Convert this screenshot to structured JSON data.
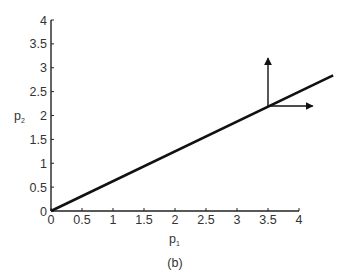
{
  "chart_data": {
    "type": "line",
    "title": "",
    "caption": "(b)",
    "xlabel": "p1",
    "ylabel": "p2",
    "xlabel_main": "p",
    "xlabel_sub": "1",
    "ylabel_main": "p",
    "ylabel_sub": "2",
    "xlim": [
      0,
      4
    ],
    "ylim": [
      0,
      4
    ],
    "xticks": [
      0,
      0.5,
      1,
      1.5,
      2,
      2.5,
      3,
      3.5,
      4
    ],
    "xtick_labels": [
      "0",
      "0.5",
      "1",
      "1.5",
      "2",
      "2.5",
      "3",
      "3.5",
      "4"
    ],
    "yticks": [
      0,
      0.5,
      1,
      1.5,
      2,
      2.5,
      3,
      3.5,
      4
    ],
    "ytick_labels": [
      "0",
      "0.5",
      "1",
      "1.5",
      "2",
      "2.5",
      "3",
      "3.5",
      "4"
    ],
    "grid": false,
    "legend": null,
    "series": [
      {
        "name": "line",
        "x": [
          0,
          4.55
        ],
        "y": [
          0,
          2.84
        ],
        "color": "#111111"
      }
    ],
    "annotations": [
      {
        "type": "arrow",
        "from": [
          3.5,
          2.2
        ],
        "to": [
          3.5,
          3.2
        ],
        "direction": "up"
      },
      {
        "type": "arrow",
        "from": [
          3.5,
          2.2
        ],
        "to": [
          4.22,
          2.2
        ],
        "direction": "right"
      }
    ]
  }
}
